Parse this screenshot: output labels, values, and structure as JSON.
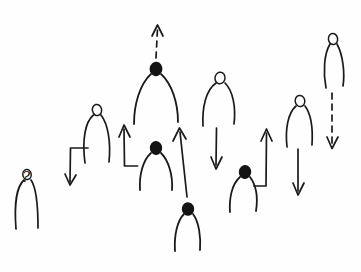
{
  "canvas": {
    "width": 361,
    "height": 272,
    "background_color": "#fefefe",
    "ink_color": "#1a1a1a",
    "medium": "hand-drawn pen sketch"
  },
  "annotations": {
    "question_mark": "?",
    "question_mark_position": {
      "x": 27,
      "y": 178
    }
  },
  "figures": [
    {
      "id": "figure-1",
      "label": "arch figure with question mark",
      "head_style": "hollow",
      "head": {
        "cx": 27,
        "cy": 174,
        "rx": 4.2,
        "ry": 5.0
      },
      "body": {
        "apex_x": 27,
        "apex_y": 179,
        "left_x": 16,
        "right_x": 38,
        "foot_y": 229,
        "spread": 11
      },
      "arrow": "none"
    },
    {
      "id": "figure-2",
      "label": "arch figure with elbow arrow down-left",
      "head_style": "hollow",
      "head": {
        "cx": 97,
        "cy": 110,
        "rx": 4.6,
        "ry": 5.4
      },
      "body": {
        "apex_x": 97,
        "apex_y": 116,
        "left_x": 83,
        "right_x": 110,
        "foot_y": 163,
        "spread": 14
      },
      "arrow": "elbow-down-left"
    },
    {
      "id": "figure-3",
      "label": "filled head figure with dashed arrow up",
      "head_style": "filled",
      "head": {
        "cx": 156,
        "cy": 69,
        "rx": 6.0,
        "ry": 6.5
      },
      "body": {
        "apex_x": 156,
        "apex_y": 75,
        "left_x": 139,
        "right_x": 172,
        "foot_y": 123,
        "spread": 17
      },
      "arrow": "dashed-up"
    },
    {
      "id": "figure-4",
      "label": "filled head figure with elbow arrow up-left",
      "head_style": "filled",
      "head": {
        "cx": 156,
        "cy": 148,
        "rx": 5.6,
        "ry": 6.2
      },
      "body": {
        "apex_x": 156,
        "apex_y": 154,
        "left_x": 140,
        "right_x": 172,
        "foot_y": 190,
        "spread": 16
      },
      "arrow": "elbow-up-left"
    },
    {
      "id": "figure-5",
      "label": "arch figure with straight arrow down",
      "head_style": "hollow",
      "head": {
        "cx": 220,
        "cy": 78,
        "rx": 5.2,
        "ry": 5.8
      },
      "body": {
        "apex_x": 220,
        "apex_y": 84,
        "left_x": 203,
        "right_x": 234,
        "foot_y": 125,
        "spread": 16
      },
      "arrow": "straight-down"
    },
    {
      "id": "figure-6",
      "label": "filled head figure at bottom with long slanted arrow up",
      "head_style": "filled",
      "head": {
        "cx": 188,
        "cy": 209,
        "rx": 5.6,
        "ry": 6.0
      },
      "body": {
        "apex_x": 188,
        "apex_y": 215,
        "left_x": 175,
        "right_x": 200,
        "foot_y": 250,
        "spread": 13
      },
      "arrow": "long-slanted-up"
    },
    {
      "id": "figure-7",
      "label": "filled head figure with elbow arrow up-right",
      "head_style": "filled",
      "head": {
        "cx": 245,
        "cy": 172,
        "rx": 5.6,
        "ry": 6.2
      },
      "body": {
        "apex_x": 245,
        "apex_y": 178,
        "left_x": 230,
        "right_x": 256,
        "foot_y": 212,
        "spread": 15
      },
      "arrow": "elbow-up-right"
    },
    {
      "id": "figure-8",
      "label": "arch figure with straight arrow down",
      "head_style": "hollow",
      "head": {
        "cx": 300,
        "cy": 101,
        "rx": 4.8,
        "ry": 5.4
      },
      "body": {
        "apex_x": 300,
        "apex_y": 107,
        "left_x": 287,
        "right_x": 312,
        "foot_y": 147,
        "spread": 13
      },
      "arrow": "straight-down-2"
    },
    {
      "id": "figure-9",
      "label": "tall narrow figure with dashed arrow down",
      "head_style": "hollow",
      "head": {
        "cx": 333,
        "cy": 39,
        "rx": 4.6,
        "ry": 5.4
      },
      "body": {
        "apex_x": 333,
        "apex_y": 45,
        "left_x": 325,
        "right_x": 345,
        "foot_y": 88,
        "spread": 9
      },
      "arrow": "dashed-down"
    }
  ],
  "arrows": [
    {
      "id": "elbow-down-left",
      "type": "elbow",
      "style": "solid",
      "direction": "down",
      "path": "M 88 148 L 70 148 L 70 183",
      "head_at": {
        "x": 70,
        "y": 186
      }
    },
    {
      "id": "dashed-up",
      "type": "straight",
      "style": "dashed",
      "direction": "up",
      "path": "M 156 58 L 157 28",
      "head_at": {
        "x": 157,
        "y": 25
      }
    },
    {
      "id": "elbow-up-left",
      "type": "elbow",
      "style": "solid",
      "direction": "up",
      "path": "M 137 165 L 124 165 L 124 128",
      "head_at": {
        "x": 124,
        "y": 125
      }
    },
    {
      "id": "straight-down",
      "type": "straight",
      "style": "solid",
      "direction": "down",
      "path": "M 216 128 L 216 166",
      "head_at": {
        "x": 216,
        "y": 169
      }
    },
    {
      "id": "long-slanted-up",
      "type": "straight",
      "style": "solid",
      "direction": "up-slanted",
      "path": "M 187 196 L 180 131",
      "head_at": {
        "x": 180,
        "y": 128
      }
    },
    {
      "id": "elbow-up-right",
      "type": "elbow",
      "style": "solid",
      "direction": "up",
      "path": "M 254 186 L 266 186 L 266 132",
      "head_at": {
        "x": 266,
        "y": 128
      }
    },
    {
      "id": "straight-down-2",
      "type": "straight",
      "style": "solid",
      "direction": "down",
      "path": "M 298 148 L 298 192",
      "head_at": {
        "x": 298,
        "y": 195
      }
    },
    {
      "id": "dashed-down",
      "type": "straight",
      "style": "dashed",
      "direction": "down",
      "path": "M 332 92 L 332 145",
      "head_at": {
        "x": 332,
        "y": 149
      }
    }
  ],
  "summary": {
    "figure_count": 9,
    "arrow_count": 8,
    "filled_head_count": 4,
    "hollow_head_count": 5
  }
}
